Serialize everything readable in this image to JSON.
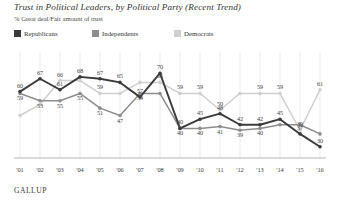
{
  "header": {
    "title": "Trust in Political Leaders, by Political Party (Recent Trend)",
    "subtitle": "% Great deal/Fair amount of trust"
  },
  "legend": {
    "position": "top-left",
    "items": [
      {
        "label": "Republicans",
        "color": "#3a3a3a"
      },
      {
        "label": "Independents",
        "color": "#8d8d8d"
      },
      {
        "label": "Democrats",
        "color": "#cfcfcf"
      }
    ]
  },
  "source": "GALLUP",
  "chart_data": {
    "type": "line",
    "title": "Trust in Political Leaders, by Political Party (Recent Trend)",
    "subtitle": "% Great deal/Fair amount of trust",
    "xlabel": "",
    "ylabel": "",
    "ylim": [
      25,
      75
    ],
    "grid": "vertical",
    "legend_position": "top-left",
    "categories": [
      "'01",
      "'02",
      "'03",
      "'04",
      "'05",
      "'06",
      "'07",
      "'08",
      "'09",
      "'10",
      "'11",
      "'12",
      "'13",
      "'14",
      "'15",
      "'16"
    ],
    "series": [
      {
        "name": "Republicans",
        "color": "#3a3a3a",
        "values": [
          60,
          67,
          61,
          68,
          67,
          65,
          57,
          70,
          40,
          45,
          48,
          42,
          42,
          45,
          37,
          30
        ]
      },
      {
        "name": "Independents",
        "color": "#8d8d8d",
        "values": [
          59,
          55,
          55,
          59,
          51,
          47,
          59,
          40,
          40,
          41,
          39,
          40,
          null,
          null,
          null,
          null
        ]
      },
      {
        "name": "Democrats",
        "color": "#cfcfcf",
        "values": [
          47,
          53,
          66,
          59,
          65,
          59,
          50,
          59,
          59,
          39,
          61,
          null,
          null,
          null,
          null,
          null
        ]
      }
    ],
    "plotted_points": {
      "Republicans": [
        {
          "x": "'01",
          "y": 60
        },
        {
          "x": "'02",
          "y": 67
        },
        {
          "x": "'03",
          "y": 61
        },
        {
          "x": "'04",
          "y": 68
        },
        {
          "x": "'05",
          "y": 67
        },
        {
          "x": "'06",
          "y": 65
        },
        {
          "x": "'07",
          "y": 57
        },
        {
          "x": "'08",
          "y": 70
        },
        {
          "x": "'09",
          "y": 40
        },
        {
          "x": "'10",
          "y": 45
        },
        {
          "x": "'11",
          "y": 48
        },
        {
          "x": "'12",
          "y": 42
        },
        {
          "x": "'13",
          "y": 42
        },
        {
          "x": "'14",
          "y": 45
        },
        {
          "x": "'15",
          "y": 37
        },
        {
          "x": "'16",
          "y": 30
        }
      ],
      "Independents": [
        {
          "x": "'01",
          "y": 59
        },
        {
          "x": "'02",
          "y": 55
        },
        {
          "x": "'03",
          "y": 55
        },
        {
          "x": "'04",
          "y": 59
        },
        {
          "x": "'05",
          "y": 51
        },
        {
          "x": "'06",
          "y": 47
        },
        {
          "x": "'07",
          "y": 59
        },
        {
          "x": "'08",
          "y": 59
        },
        {
          "x": "'09",
          "y": 40
        },
        {
          "x": "'10",
          "y": 40
        },
        {
          "x": "'11",
          "y": 41
        },
        {
          "x": "'12",
          "y": 39
        },
        {
          "x": "'13",
          "y": 40
        },
        {
          "x": "'14",
          "y": 42
        },
        {
          "x": "'15",
          "y": 42
        },
        {
          "x": "'16",
          "y": 37
        }
      ],
      "Democrats": [
        {
          "x": "'01",
          "y": 47
        },
        {
          "x": "'02",
          "y": 53
        },
        {
          "x": "'03",
          "y": 66
        },
        {
          "x": "'04",
          "y": 66
        },
        {
          "x": "'05",
          "y": 59
        },
        {
          "x": "'06",
          "y": 59
        },
        {
          "x": "'07",
          "y": 65
        },
        {
          "x": "'08",
          "y": 65
        },
        {
          "x": "'09",
          "y": 59
        },
        {
          "x": "'10",
          "y": 59
        },
        {
          "x": "'11",
          "y": 50
        },
        {
          "x": "'12",
          "y": 59
        },
        {
          "x": "'13",
          "y": 59
        },
        {
          "x": "'14",
          "y": 59
        },
        {
          "x": "'15",
          "y": 39
        },
        {
          "x": "'16",
          "y": 61
        }
      ]
    },
    "visible_data_labels": [
      {
        "series": "Republicans",
        "x": "'01",
        "value": 60
      },
      {
        "series": "Republicans",
        "x": "'02",
        "value": 67
      },
      {
        "series": "Republicans",
        "x": "'03",
        "value": 61
      },
      {
        "series": "Republicans",
        "x": "'04",
        "value": 68
      },
      {
        "series": "Republicans",
        "x": "'05",
        "value": 67
      },
      {
        "series": "Republicans",
        "x": "'06",
        "value": 65
      },
      {
        "series": "Republicans",
        "x": "'07",
        "value": 57
      },
      {
        "series": "Republicans",
        "x": "'08",
        "value": 70
      },
      {
        "series": "Republicans",
        "x": "'09",
        "value": 40
      },
      {
        "series": "Republicans",
        "x": "'10",
        "value": 45
      },
      {
        "series": "Republicans",
        "x": "'11",
        "value": 48
      },
      {
        "series": "Republicans",
        "x": "'12",
        "value": 42
      },
      {
        "series": "Republicans",
        "x": "'13",
        "value": 42
      },
      {
        "series": "Republicans",
        "x": "'14",
        "value": 45
      },
      {
        "series": "Republicans",
        "x": "'15",
        "value": 37
      },
      {
        "series": "Republicans",
        "x": "'16",
        "value": 30
      },
      {
        "series": "Independents",
        "x": "'01",
        "value": 59
      },
      {
        "series": "Independents",
        "x": "'02",
        "value": 53
      },
      {
        "series": "Independents",
        "x": "'03",
        "value": 55
      },
      {
        "series": "Independents",
        "x": "'04",
        "value": 55
      },
      {
        "series": "Independents",
        "x": "'05",
        "value": 51
      },
      {
        "series": "Independents",
        "x": "'06",
        "value": 47
      },
      {
        "series": "Independents",
        "x": "'07",
        "value": 59
      },
      {
        "series": "Independents",
        "x": "'09",
        "value": 40
      },
      {
        "series": "Independents",
        "x": "'10",
        "value": 40
      },
      {
        "series": "Independents",
        "x": "'11",
        "value": 41
      },
      {
        "series": "Independents",
        "x": "'12",
        "value": 39
      },
      {
        "series": "Independents",
        "x": "'13",
        "value": 40
      },
      {
        "series": "Democrats",
        "x": "'03",
        "value": 66
      },
      {
        "series": "Democrats",
        "x": "'05",
        "value": 59
      },
      {
        "series": "Democrats",
        "x": "'08",
        "value": 65
      },
      {
        "series": "Democrats",
        "x": "'09",
        "value": 59
      },
      {
        "series": "Democrats",
        "x": "'10",
        "value": 59
      },
      {
        "series": "Democrats",
        "x": "'11",
        "value": 50
      },
      {
        "series": "Democrats",
        "x": "'13",
        "value": 59
      },
      {
        "series": "Democrats",
        "x": "'14",
        "value": 59
      },
      {
        "series": "Democrats",
        "x": "'15",
        "value": 39
      },
      {
        "series": "Democrats",
        "x": "'16",
        "value": 61
      }
    ]
  }
}
